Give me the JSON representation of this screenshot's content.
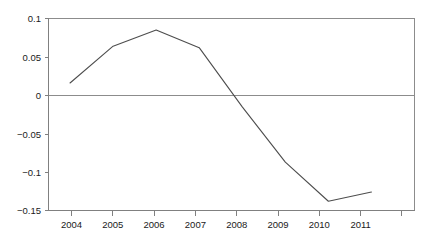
{
  "chart_data": {
    "type": "line",
    "title": "",
    "subtitle": "",
    "xlabel": "",
    "ylabel": "",
    "categories": [
      "2004",
      "2005",
      "2006",
      "2007",
      "2008",
      "2009",
      "2010",
      "2011"
    ],
    "x": [
      2004,
      2005,
      2006,
      2007,
      2008,
      2009,
      2010,
      2011
    ],
    "values": [
      0.016,
      0.064,
      0.085,
      0.062,
      -0.015,
      -0.087,
      -0.138,
      -0.126
    ],
    "series": [
      {
        "name": "",
        "values": [
          0.016,
          0.064,
          0.085,
          0.062,
          -0.015,
          -0.087,
          -0.138,
          -0.126
        ]
      }
    ],
    "ylim": [
      -0.15,
      0.1
    ],
    "xlim": [
      2003.5,
      2012
    ],
    "y_ticks": [
      0.1,
      0.05,
      0,
      -0.05,
      -0.1,
      -0.15
    ],
    "y_tick_labels": [
      "0.1",
      "0.05",
      "0",
      "−0.05",
      "−0.1",
      "−0.15"
    ],
    "x_ticks": [
      2004,
      2005,
      2006,
      2007,
      2008,
      2009,
      2010,
      2011
    ],
    "x_tick_labels": [
      "2004",
      "2005",
      "2006",
      "2007",
      "2008",
      "2009",
      "2010",
      "2011"
    ],
    "grid": false,
    "legend": "none",
    "zero_line": 0,
    "annotations": []
  },
  "colors": {
    "series_line": "#4d4d4d",
    "axis": "#808080",
    "frame": "#8c8c8c",
    "zero_line": "#8c8c8c",
    "text": "#1a1a1a",
    "background": "#ffffff"
  },
  "axis": {
    "y_labels": [
      "0.1",
      "0.05",
      "0",
      "−0.05",
      "−0.1",
      "−0.15"
    ],
    "x_labels": [
      "2004",
      "2005",
      "2006",
      "2007",
      "2008",
      "2009",
      "2010",
      "2011"
    ]
  }
}
